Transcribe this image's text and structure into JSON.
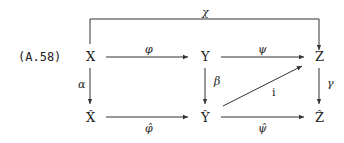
{
  "equation_number": "(A.58)",
  "nodes": {
    "X": "X",
    "Y": "Y",
    "Z": "Z",
    "X_hat": "X̂",
    "Y_hat": "Ŷ",
    "Z_hat": "Ẑ"
  },
  "arrows": {
    "chi": "χ",
    "phi": "φ",
    "psi": "ψ",
    "alpha": "α",
    "beta": "β",
    "gamma": "γ",
    "phi_hat": "φ̂",
    "psi_hat": "ψ̂",
    "i": "i"
  }
}
